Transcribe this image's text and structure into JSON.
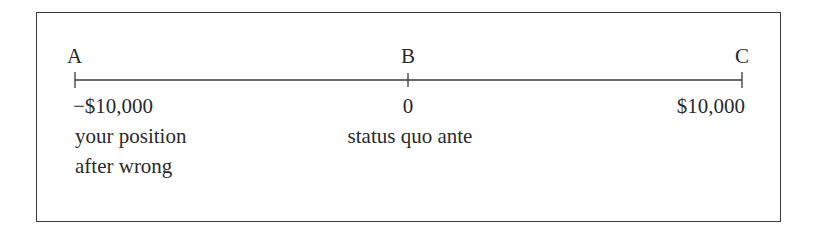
{
  "diagram": {
    "type": "number-line",
    "points": [
      {
        "letter": "A",
        "value": "−$10,000",
        "description_lines": [
          "your position",
          "after wrong"
        ]
      },
      {
        "letter": "B",
        "value": "0",
        "description_lines": [
          "status quo ante"
        ]
      },
      {
        "letter": "C",
        "value": "$10,000",
        "description_lines": []
      }
    ],
    "colors": {
      "line": "#3a3a3a",
      "text": "#2a2a2a",
      "background": "#ffffff"
    }
  }
}
